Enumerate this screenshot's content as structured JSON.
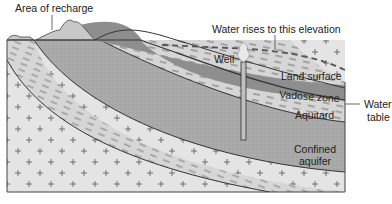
{
  "diagram": {
    "type": "cross-section",
    "labels": {
      "recharge": "Area of recharge",
      "water_rises": "Water rises to this elevation",
      "well": "Well",
      "land_surface": "Land surface",
      "vadose_zone": "Vadose zone",
      "aquitard": "Aquitard",
      "confined_aquifer_line1": "Confined",
      "confined_aquifer_line2": "aquifer",
      "water_table_line1": "Water",
      "water_table_line2": "table"
    },
    "colors": {
      "bedrock": "#e4e4e4",
      "aquitard": "#d6d6d6",
      "aquifer": "#a9a9a9",
      "vadose": "#8e8e8e",
      "recharge_hill": "#c8c8c8",
      "outline": "#333333"
    }
  }
}
